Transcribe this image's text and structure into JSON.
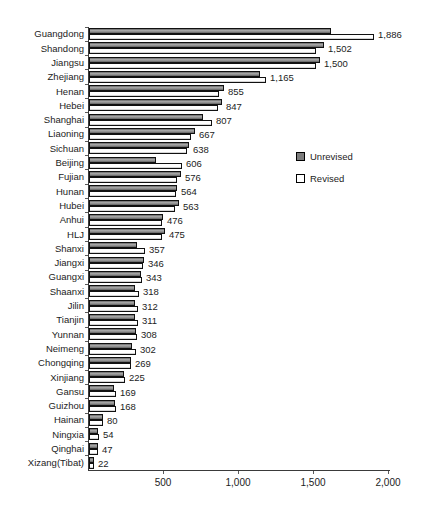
{
  "chart_data": {
    "type": "bar",
    "orientation": "horizontal",
    "title": "",
    "xlabel": "",
    "ylabel": "",
    "xlim": [
      0,
      2000
    ],
    "x_ticks": [
      500,
      1000,
      1500,
      2000
    ],
    "x_tick_labels": [
      "500",
      "1,000",
      "1,500",
      "2,000"
    ],
    "grid": false,
    "legend_position": "right-middle",
    "categories": [
      "Guangdong",
      "Shandong",
      "Jiangsu",
      "Zhejiang",
      "Henan",
      "Hebei",
      "Shanghai",
      "Liaoning",
      "Sichuan",
      "Beijing",
      "Fujian",
      "Hunan",
      "Hubei",
      "Anhui",
      "HLJ",
      "Shanxi",
      "Jiangxi",
      "Guangxi",
      "Shaanxi",
      "Jilin",
      "Tianjin",
      "Yunnan",
      "Neimeng",
      "Chongqing",
      "Xinjiang",
      "Gansu",
      "Guizhou",
      "Hainan",
      "Ningxia",
      "Qinghai",
      "Xizang(Tibat)"
    ],
    "series": [
      {
        "name": "Unrevised",
        "color": "#7d7d7d",
        "values_estimated": true,
        "values": [
          1600,
          1550,
          1525,
          1125,
          885,
          875,
          745,
          690,
          655,
          430,
          600,
          570,
          585,
          480,
          495,
          305,
          350,
          330,
          295,
          295,
          295,
          300,
          270,
          265,
          220,
          155,
          160,
          77,
          47,
          47,
          21
        ]
      },
      {
        "name": "Revised",
        "color": "#ffffff",
        "values_estimated": false,
        "values": [
          1886,
          1502,
          1500,
          1165,
          855,
          847,
          807,
          667,
          638,
          606,
          576,
          564,
          563,
          476,
          475,
          357,
          346,
          343,
          318,
          312,
          311,
          308,
          302,
          269,
          225,
          169,
          168,
          80,
          54,
          47,
          22
        ]
      }
    ],
    "value_labels": [
      "1,886",
      "1,502",
      "1,500",
      "1,165",
      "855",
      "847",
      "807",
      "667",
      "638",
      "606",
      "576",
      "564",
      "563",
      "476",
      "475",
      "357",
      "346",
      "343",
      "318",
      "312",
      "311",
      "308",
      "302",
      "269",
      "225",
      "169",
      "168",
      "80",
      "54",
      "47",
      "22"
    ],
    "value_labels_refer_to": "Revised"
  },
  "colors": {
    "background": "#ffffff",
    "axis": "#3a3a3a",
    "text": "#1c1c1c",
    "unrevised_fill": "#7d7d7d",
    "revised_fill": "#ffffff",
    "bar_border": "#111111"
  }
}
